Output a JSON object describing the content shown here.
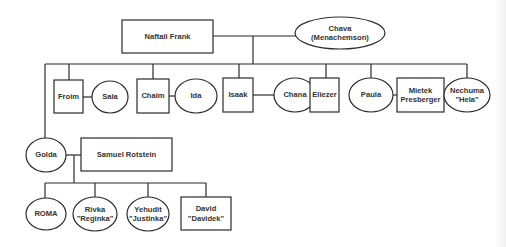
{
  "diagram": {
    "type": "family-tree",
    "colors": {
      "line": "#2b2b2b",
      "text": "#333333",
      "background": "#ffffff"
    },
    "people": {
      "naftali": {
        "label": "Naftali Frank",
        "shape": "rectangle",
        "role": "father"
      },
      "chava": {
        "label": "Chava\n(Menachemson)",
        "shape": "ellipse",
        "role": "mother"
      },
      "froim": {
        "label": "Froim",
        "shape": "rectangle"
      },
      "sala": {
        "label": "Sala",
        "shape": "ellipse",
        "spouse_of": "Froim"
      },
      "chaim": {
        "label": "Chaim",
        "shape": "rectangle"
      },
      "ida": {
        "label": "Ida",
        "shape": "ellipse",
        "spouse_of": "Chaim"
      },
      "isaak": {
        "label": "Isaak",
        "shape": "rectangle"
      },
      "chana": {
        "label": "Chana",
        "shape": "ellipse",
        "spouse_of": "Isaak"
      },
      "eliezer": {
        "label": "Eliezer",
        "shape": "rectangle"
      },
      "paula": {
        "label": "Paula",
        "shape": "ellipse"
      },
      "mietek": {
        "label": "Mietek\nPresberger",
        "shape": "rectangle",
        "spouse_of": "Paula"
      },
      "nechuma": {
        "label": "Nechuma\n\"Hela\"",
        "shape": "ellipse"
      },
      "golda": {
        "label": "Golda",
        "shape": "ellipse"
      },
      "samuel": {
        "label": "Samuel Rotstein",
        "shape": "rectangle",
        "spouse_of": "Golda"
      },
      "roma": {
        "label": "ROMA",
        "shape": "ellipse"
      },
      "rivka": {
        "label": "Rivka\n\"Reginka\"",
        "shape": "ellipse"
      },
      "yehudit": {
        "label": "Yehudit\n\"Justinka\"",
        "shape": "ellipse"
      },
      "david": {
        "label": "David\n\"Davidek\"",
        "shape": "rectangle"
      }
    },
    "generations": [
      [
        "Naftali Frank",
        "Chava (Menachemson)"
      ],
      [
        "Golda",
        "Froim",
        "Chaim",
        "Isaak",
        "Eliezer",
        "Paula",
        "Nechuma \"Hela\""
      ],
      [
        "ROMA",
        "Rivka \"Reginka\"",
        "Yehudit \"Justinka\"",
        "David \"Davidek\""
      ]
    ]
  }
}
